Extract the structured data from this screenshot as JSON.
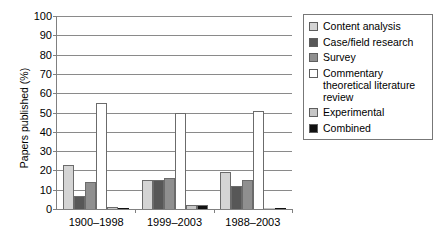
{
  "chart_data": {
    "type": "bar",
    "title": "",
    "xlabel": "",
    "ylabel": "Papers published (%)",
    "ylim": [
      0,
      100
    ],
    "yticks": [
      0,
      10,
      20,
      30,
      40,
      50,
      60,
      70,
      80,
      90,
      100
    ],
    "grid": true,
    "legend_position": "right",
    "categories": [
      "1900–1998",
      "1999–2003",
      "1988–2003"
    ],
    "series": [
      {
        "name": "Content analysis",
        "color": "#d4d4d4",
        "values": [
          23,
          15,
          19
        ]
      },
      {
        "name": "Case/field research",
        "color": "#575757",
        "values": [
          7,
          15,
          12
        ]
      },
      {
        "name": "Survey",
        "color": "#8f8f8f",
        "values": [
          14,
          16,
          15
        ]
      },
      {
        "name": "Commentary theoretical literature review",
        "color": "#ffffff",
        "values": [
          55,
          50,
          51
        ]
      },
      {
        "name": "Experimental",
        "color": "#c6c6c6",
        "values": [
          1,
          2,
          0.7
        ]
      },
      {
        "name": "Combined",
        "color": "#111111",
        "values": [
          0.5,
          2,
          0.7
        ]
      }
    ]
  },
  "legend": {
    "entries": [
      {
        "label": "Content analysis"
      },
      {
        "label": "Case/field research"
      },
      {
        "label": "Survey"
      },
      {
        "label": "Commentary theoretical literature review"
      },
      {
        "label": "Experimental"
      },
      {
        "label": "Combined"
      }
    ]
  }
}
